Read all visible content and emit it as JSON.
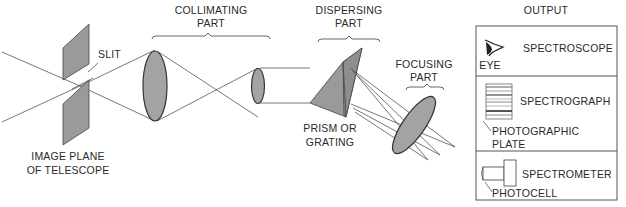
{
  "diagram": {
    "labels": {
      "slit": "SLIT",
      "image_plane_line1": "IMAGE PLANE",
      "image_plane_line2": "OF TELESCOPE",
      "collimating_line1": "COLLIMATING",
      "collimating_line2": "PART",
      "dispersing_line1": "DISPERSING",
      "dispersing_line2": "PART",
      "prism_line1": "PRISM OR",
      "prism_line2": "GRATING",
      "focusing_line1": "FOCUSING",
      "focusing_line2": "PART",
      "output": "OUTPUT"
    },
    "output_panels": [
      {
        "name": "SPECTROSCOPE",
        "sublabel": "EYE",
        "icon": "eye-icon"
      },
      {
        "name": "SPECTROGRAPH",
        "sublabel_line1": "PHOTOGRAPHIC",
        "sublabel_line2": "PLATE",
        "icon": "photographic-plate-icon"
      },
      {
        "name": "SPECTROMETER",
        "sublabel": "PHOTOCELL",
        "icon": "photocell-icon"
      }
    ],
    "colors": {
      "component_fill": "#9a9a9a",
      "line": "#555555",
      "text": "#2a2a2a"
    }
  }
}
